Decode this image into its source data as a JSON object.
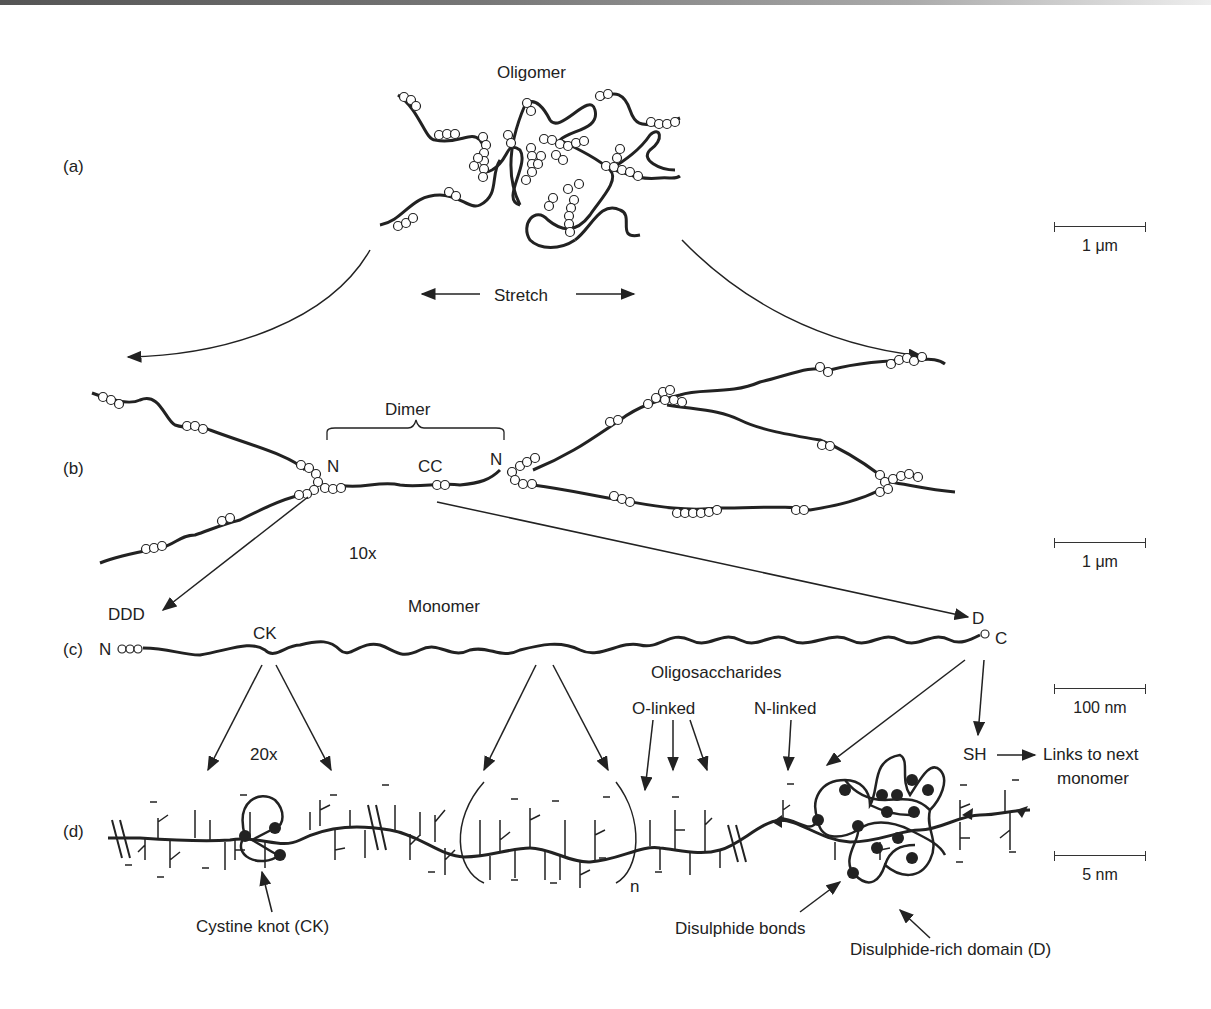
{
  "figure": {
    "panels": [
      {
        "id": "a",
        "label": "(a)",
        "title": "Oligomer"
      },
      {
        "id": "b",
        "label": "(b)",
        "title": "Dimer",
        "magnification": "10x"
      },
      {
        "id": "c",
        "label": "(c)",
        "title": "Monomer",
        "magnification": "20x"
      },
      {
        "id": "d",
        "label": "(d)"
      }
    ],
    "stretch_label": "Stretch",
    "dimer_labels": {
      "n_left": "N",
      "cc": "CC",
      "n_right": "N"
    },
    "monomer_labels": {
      "ddd": "DDD",
      "n": "N",
      "ck": "CK",
      "d": "D",
      "c": "C"
    },
    "oligosaccharides": {
      "title": "Oligosaccharides",
      "o_linked": "O-linked",
      "n_linked": "N-linked"
    },
    "repeat_index": "n",
    "sh_label": "SH",
    "links_label": [
      "Links to next",
      "monomer"
    ],
    "annotations": {
      "cystine_knot": "Cystine knot (CK)",
      "disulphide_bonds": "Disulphide bonds",
      "disulphide_domain": "Disulphide-rich domain (D)"
    },
    "scale_bars": [
      {
        "panel": "a",
        "value": "1 μm"
      },
      {
        "panel": "b",
        "value": "1 μm"
      },
      {
        "panel": "c",
        "value": "100 nm"
      },
      {
        "panel": "d",
        "value": "5 nm"
      }
    ],
    "colors": {
      "ink": "#222222",
      "background": "#ffffff"
    }
  }
}
